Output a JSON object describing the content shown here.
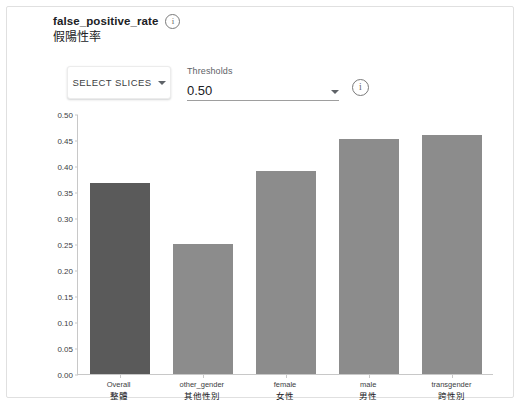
{
  "header": {
    "metric_name": "false_positive_rate",
    "metric_name_cn": "假陽性率",
    "info_icon": "info-circle-icon"
  },
  "controls": {
    "select_slices_label": "SELECT SLICES",
    "select_slices_caret": "chevron-down-icon",
    "threshold_label": "Thresholds",
    "threshold_value": "0.50",
    "threshold_caret": "chevron-down-icon",
    "threshold_info_icon": "info-circle-icon"
  },
  "chart_data": {
    "type": "bar",
    "title": "false_positive_rate",
    "xlabel": "",
    "ylabel": "",
    "ylim": [
      0,
      0.5
    ],
    "grid": false,
    "legend": null,
    "categories": [
      "Overall",
      "other_gender",
      "female",
      "male",
      "transgender"
    ],
    "categories_cn": [
      "整體",
      "其他性別",
      "女性",
      "男性",
      "跨性別"
    ],
    "values": [
      0.367,
      0.25,
      0.39,
      0.452,
      0.46
    ],
    "yticks": [
      "0.00",
      "0.05",
      "0.10",
      "0.15",
      "0.20",
      "0.25",
      "0.30",
      "0.35",
      "0.40",
      "0.45",
      "0.50"
    ],
    "ytick_values": [
      0.0,
      0.05,
      0.1,
      0.15,
      0.2,
      0.25,
      0.3,
      0.35,
      0.4,
      0.45,
      0.5
    ],
    "colors": {
      "overall_bar": "#5a5a5a",
      "slice_bar": "#8c8c8c",
      "axis": "#c8c8c8"
    }
  }
}
